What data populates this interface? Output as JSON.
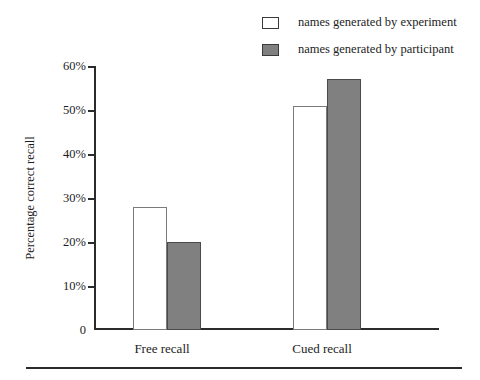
{
  "chart_data": {
    "type": "bar",
    "title": "",
    "subtitle": "",
    "xlabel": "",
    "ylabel": "Percentage correct recall",
    "categories": [
      "Free recall",
      "Cued recall"
    ],
    "series": [
      {
        "name": "names generated by experiment",
        "swatch": "white",
        "color": "#ffffff",
        "values": [
          28,
          51
        ]
      },
      {
        "name": "names generated by participant",
        "swatch": "grey",
        "color": "#808080",
        "values": [
          20,
          57
        ]
      }
    ],
    "ylim": [
      0,
      60
    ],
    "y_ticks": [
      0,
      10,
      20,
      30,
      40,
      50,
      60
    ],
    "y_tick_labels": [
      "0",
      "10%",
      "20%",
      "30%",
      "40%",
      "50%",
      "60%"
    ],
    "grid": false,
    "legend_position": "top-right",
    "annotations": []
  },
  "legend": {
    "items": [
      {
        "label": "names generated by experiment",
        "swatch": "white"
      },
      {
        "label": "names generated by participant",
        "swatch": "grey"
      }
    ]
  },
  "axes": {
    "y_title": "Percentage correct recall",
    "y_labels": [
      "60%",
      "50%",
      "40%",
      "30%",
      "20%",
      "10%",
      "0"
    ],
    "x_labels": [
      "Free recall",
      "Cued recall"
    ]
  },
  "colors": {
    "bar_white": "#ffffff",
    "bar_grey": "#808080",
    "axis": "#2b2b2b",
    "text": "#1d1d1d"
  }
}
